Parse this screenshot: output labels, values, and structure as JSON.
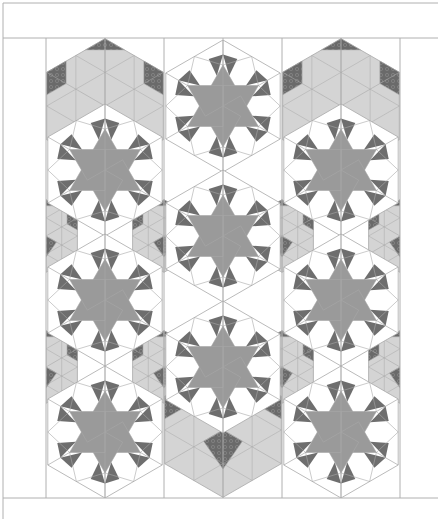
{
  "canvas": {
    "width": 438,
    "height": 519
  },
  "frame": {
    "top_band": {
      "y1": 3,
      "y2": 38
    },
    "bottom_line_y": 498,
    "left_x": 3,
    "quilt_left": 46,
    "quilt_right": 400,
    "column_lines_x": [
      46,
      164,
      282,
      400
    ],
    "line_color": "#b0b0b0"
  },
  "colors": {
    "background": "#ffffff",
    "seam": "#a8a8a8",
    "star": "#9a9a9a",
    "star_point_dark": "#6e6e6e",
    "cube_light": "#d4d4d4",
    "cube_dark": "#6a6a6a",
    "white_patch": "#ffffff"
  },
  "blocks": {
    "radius": 66,
    "stars": [
      {
        "cx": 223,
        "cy": 106
      },
      {
        "cx": 105,
        "cy": 170
      },
      {
        "cx": 341,
        "cy": 170
      },
      {
        "cx": 223,
        "cy": 236
      },
      {
        "cx": 105,
        "cy": 300
      },
      {
        "cx": 341,
        "cy": 300
      },
      {
        "cx": 223,
        "cy": 367
      },
      {
        "cx": 105,
        "cy": 432
      },
      {
        "cx": 341,
        "cy": 432
      }
    ],
    "cubes": [
      {
        "cx": 105,
        "cy": 106
      },
      {
        "cx": 341,
        "cy": 106
      },
      {
        "cx": 223,
        "cy": 430
      }
    ],
    "small_cubes": [
      {
        "cx": 164,
        "cy": 236
      },
      {
        "cx": 282,
        "cy": 236
      },
      {
        "cx": 46,
        "cy": 236
      },
      {
        "cx": 400,
        "cy": 236
      },
      {
        "cx": 164,
        "cy": 367
      },
      {
        "cx": 282,
        "cy": 367
      },
      {
        "cx": 46,
        "cy": 367
      },
      {
        "cx": 400,
        "cy": 367
      }
    ]
  }
}
